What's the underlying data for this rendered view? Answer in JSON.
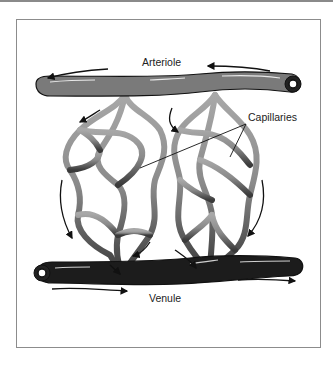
{
  "figure": {
    "labels": {
      "arteriole": "Arteriole",
      "capillaries": "Capillaries",
      "venule": "Venule"
    },
    "colors": {
      "arteriole": "#7d7d7d",
      "capillary_top": "#9a9a9a",
      "capillary_bottom": "#3a3a3a",
      "venule": "#1e1e1e",
      "outline": "#111111",
      "frame": "#8c8c8c"
    },
    "flow_arrows": {
      "arteriole": "right-to-left",
      "venule": "left-to-right"
    }
  }
}
